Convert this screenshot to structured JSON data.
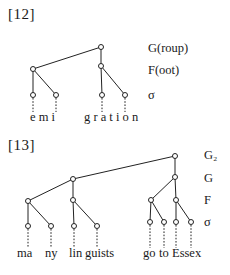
{
  "examples": [
    {
      "label": "[12]",
      "tiers": [
        "G(roup)",
        "F(oot)",
        "σ"
      ],
      "segments": [
        "e m i",
        "g r a t i o n"
      ]
    },
    {
      "label": "[13]",
      "tiers": [
        "G₂",
        "G",
        "F",
        "σ"
      ],
      "segments": [
        "ma",
        "ny",
        "lin",
        "guists",
        "go",
        "to",
        "Essex"
      ]
    }
  ]
}
